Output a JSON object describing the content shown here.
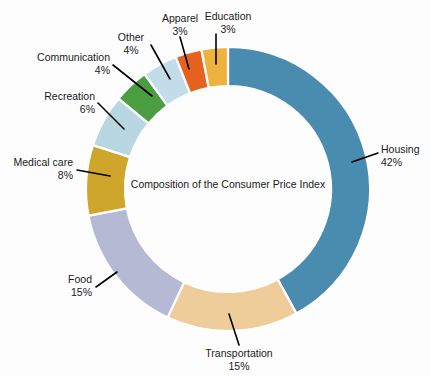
{
  "chart_data": {
    "type": "pie",
    "variant": "donut",
    "title": "Composition of the Consumer Price Index",
    "center_label": "Composition of the Consumer Price Index",
    "xlabel": "",
    "ylabel": "",
    "units": "percent",
    "total": 100,
    "start_angle_deg": 0,
    "direction": "clockwise",
    "legend": "none",
    "grid": false,
    "categories": [
      "Housing",
      "Transportation",
      "Food",
      "Medical care",
      "Recreation",
      "Communication",
      "Other",
      "Apparel",
      "Education"
    ],
    "values": [
      42,
      15,
      15,
      8,
      6,
      4,
      4,
      3,
      3
    ],
    "colors": [
      "#4a8cb0",
      "#eecd9a",
      "#b6b9d4",
      "#cfa62c",
      "#b9d7e0",
      "#4a9e3f",
      "#c3dcea",
      "#e8621f",
      "#eeb33f"
    ],
    "slices": [
      {
        "label": "Housing",
        "value": 42,
        "value_text": "42%",
        "color": "#4a8cb0"
      },
      {
        "label": "Transportation",
        "value": 15,
        "value_text": "15%",
        "color": "#eecd9a"
      },
      {
        "label": "Food",
        "value": 15,
        "value_text": "15%",
        "color": "#b6b9d4"
      },
      {
        "label": "Medical care",
        "value": 8,
        "value_text": "8%",
        "color": "#cfa62c"
      },
      {
        "label": "Recreation",
        "value": 6,
        "value_text": "6%",
        "color": "#b9d7e0"
      },
      {
        "label": "Communication",
        "value": 4,
        "value_text": "4%",
        "color": "#4a9e3f"
      },
      {
        "label": "Other",
        "value": 4,
        "value_text": "4%",
        "color": "#c3dcea"
      },
      {
        "label": "Apparel",
        "value": 3,
        "value_text": "3%",
        "color": "#e8621f"
      },
      {
        "label": "Education",
        "value": 3,
        "value_text": "3%",
        "color": "#eeb33f"
      }
    ]
  },
  "labels": {
    "housing": {
      "name": "Housing",
      "pct": "42%"
    },
    "transportation": {
      "name": "Transportation",
      "pct": "15%"
    },
    "food": {
      "name": "Food",
      "pct": "15%"
    },
    "medical_care": {
      "name": "Medical care",
      "pct": "8%"
    },
    "recreation": {
      "name": "Recreation",
      "pct": "6%"
    },
    "communication": {
      "name": "Communication",
      "pct": "4%"
    },
    "other": {
      "name": "Other",
      "pct": "4%"
    },
    "apparel": {
      "name": "Apparel",
      "pct": "3%"
    },
    "education": {
      "name": "Education",
      "pct": "3%"
    }
  },
  "center": {
    "caption": "Composition of the Consumer Price Index"
  },
  "background_color": "#fdfdfd"
}
